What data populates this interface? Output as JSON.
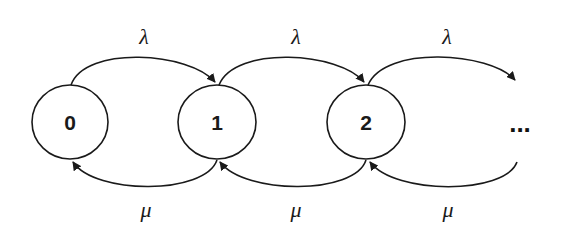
{
  "diagram": {
    "type": "birth-death Markov chain",
    "states": [
      {
        "id": "0",
        "label": "0"
      },
      {
        "id": "1",
        "label": "1"
      },
      {
        "id": "2",
        "label": "2"
      }
    ],
    "continuation": "...",
    "forward_transitions": [
      {
        "from": "0",
        "to": "1",
        "label": "λ"
      },
      {
        "from": "1",
        "to": "2",
        "label": "λ"
      },
      {
        "from": "2",
        "to": "...",
        "label": "λ"
      }
    ],
    "backward_transitions": [
      {
        "from": "1",
        "to": "0",
        "label": "μ"
      },
      {
        "from": "2",
        "to": "1",
        "label": "μ"
      },
      {
        "from": "...",
        "to": "2",
        "label": "μ"
      }
    ],
    "colors": {
      "stroke": "#1a1a1a",
      "background": "#ffffff"
    }
  }
}
